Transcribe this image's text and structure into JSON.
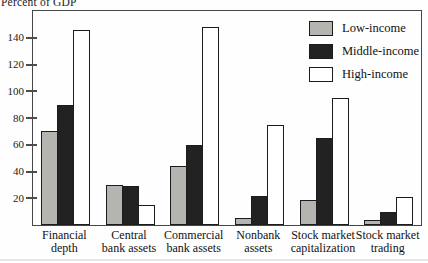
{
  "title": "Percent of GDP",
  "colors": {
    "low_income": "#b4b4b0",
    "middle_income": "#222222",
    "high_income": "#ffffff",
    "bar_border": "#1c1c1c",
    "plot_border": "#464646"
  },
  "chart_data": {
    "type": "bar",
    "title": "Percent of GDP",
    "categories": [
      "Financial depth",
      "Central bank assets",
      "Commercial bank assets",
      "Nonbank assets",
      "Stock market capitalization",
      "Stock market trading"
    ],
    "category_label_lines": [
      [
        "Financial",
        "depth"
      ],
      [
        "Central",
        "bank assets"
      ],
      [
        "Commercial",
        "bank assets"
      ],
      [
        "Nonbank",
        "assets"
      ],
      [
        "Stock market",
        "capitalization"
      ],
      [
        "Stock market",
        "trading"
      ]
    ],
    "series": [
      {
        "name": "Low-income",
        "color": "#b4b4b0",
        "values": [
          70,
          30,
          44,
          5,
          19,
          4
        ]
      },
      {
        "name": "Middle-income",
        "color": "#222222",
        "values": [
          90,
          29,
          60,
          22,
          65,
          10
        ]
      },
      {
        "name": "High-income",
        "color": "#ffffff",
        "values": [
          146,
          15,
          148,
          75,
          95,
          21
        ]
      }
    ],
    "ylabel": "Percent of GDP",
    "xlabel": "",
    "ylim": [
      0,
      160
    ],
    "yticks": [
      20,
      40,
      60,
      80,
      100,
      120,
      140
    ],
    "grid": false,
    "legend_position": "top-right"
  }
}
